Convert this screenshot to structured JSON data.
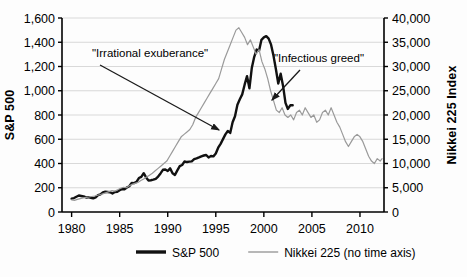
{
  "chart_data": {
    "type": "line",
    "title": "",
    "xlabel": "",
    "ylabel": "S&P 500",
    "y2label": "Nikkei 225 Index",
    "grid": true,
    "legend_position": "bottom",
    "xlim": [
      1979.0,
      2012.5
    ],
    "ylim": [
      0,
      1600
    ],
    "y2lim": [
      0,
      40000
    ],
    "x_ticks": [
      "1980",
      "1985",
      "1990",
      "1995",
      "2000",
      "2005",
      "2010"
    ],
    "x_tick_values": [
      1980,
      1985,
      1990,
      1995,
      2000,
      2005,
      2010
    ],
    "y_ticks": [
      "0",
      "200",
      "400",
      "600",
      "800",
      "1,000",
      "1,200",
      "1,400",
      "1,600"
    ],
    "y_tick_values": [
      0,
      200,
      400,
      600,
      800,
      1000,
      1200,
      1400,
      1600
    ],
    "y2_ticks": [
      "0",
      "5,000",
      "10,000",
      "15,000",
      "20,000",
      "25,000",
      "30,000",
      "35,000",
      "40,000"
    ],
    "y2_tick_values": [
      0,
      5000,
      10000,
      15000,
      20000,
      25000,
      30000,
      35000,
      40000
    ],
    "series": [
      {
        "name": "S&P 500",
        "axis": "left",
        "color": "#111111",
        "width": 2.4,
        "x": [
          1980.0,
          1980.25,
          1980.5,
          1980.75,
          1981.0,
          1981.25,
          1981.5,
          1981.75,
          1982.0,
          1982.25,
          1982.5,
          1982.75,
          1983.0,
          1983.25,
          1983.5,
          1983.75,
          1984.0,
          1984.25,
          1984.5,
          1984.75,
          1985.0,
          1985.25,
          1985.5,
          1985.75,
          1986.0,
          1986.25,
          1986.5,
          1986.75,
          1987.0,
          1987.25,
          1987.5,
          1987.75,
          1988.0,
          1988.25,
          1988.5,
          1988.75,
          1989.0,
          1989.25,
          1989.5,
          1989.75,
          1990.0,
          1990.25,
          1990.5,
          1990.75,
          1991.0,
          1991.25,
          1991.5,
          1991.75,
          1992.0,
          1992.25,
          1992.5,
          1992.75,
          1993.0,
          1993.25,
          1993.5,
          1993.75,
          1994.0,
          1994.25,
          1994.5,
          1994.75,
          1995.0,
          1995.25,
          1995.5,
          1995.75,
          1996.0,
          1996.25,
          1996.5,
          1996.75,
          1997.0,
          1997.25,
          1997.5,
          1997.75,
          1998.0,
          1998.25,
          1998.5,
          1998.75,
          1999.0,
          1999.25,
          1999.5,
          1999.75,
          2000.0,
          2000.25,
          2000.5,
          2000.75,
          2001.0,
          2001.25,
          2001.5,
          2001.75,
          2002.0,
          2002.25,
          2002.5,
          2002.75,
          2003.0
        ],
        "y": [
          110,
          115,
          126,
          136,
          132,
          128,
          120,
          122,
          117,
          112,
          120,
          139,
          145,
          162,
          167,
          165,
          163,
          153,
          165,
          167,
          180,
          188,
          188,
          202,
          212,
          240,
          238,
          248,
          280,
          290,
          320,
          285,
          260,
          262,
          267,
          274,
          292,
          318,
          348,
          350,
          338,
          360,
          320,
          306,
          343,
          378,
          388,
          417,
          412,
          415,
          418,
          436,
          442,
          450,
          459,
          466,
          470,
          450,
          462,
          459,
          482,
          530,
          562,
          601,
          640,
          668,
          652,
          740,
          790,
          885,
          930,
          970,
          1050,
          1120,
          1020,
          1190,
          1280,
          1340,
          1330,
          1420,
          1440,
          1450,
          1430,
          1380,
          1290,
          1180,
          1060,
          1140,
          1040,
          900,
          850,
          880,
          880
        ],
        "y_note": "Thick black line. Rises from ~110 in 1980 to peak ~1520 in early 2000, then falls to ~790 by 2003 where the plotted series ends."
      },
      {
        "name": "Nikkei 225 (no time axis)",
        "axis": "right",
        "color": "#9a9a9a",
        "width": 1.2,
        "x": [
          1980.0,
          1980.3,
          1980.6,
          1980.9,
          1981.2,
          1981.5,
          1981.8,
          1982.1,
          1982.4,
          1982.7,
          1983.0,
          1983.3,
          1983.6,
          1983.9,
          1984.2,
          1984.5,
          1984.8,
          1985.1,
          1985.4,
          1985.7,
          1986.0,
          1986.3,
          1986.6,
          1986.9,
          1987.2,
          1987.5,
          1987.8,
          1988.1,
          1988.4,
          1988.7,
          1989.0,
          1989.3,
          1989.6,
          1989.9,
          1990.2,
          1990.5,
          1990.8,
          1991.1,
          1991.4,
          1991.7,
          1992.0,
          1992.3,
          1992.6,
          1992.9,
          1993.2,
          1993.5,
          1993.8,
          1994.1,
          1994.4,
          1994.7,
          1995.0,
          1995.3,
          1995.6,
          1995.9,
          1996.2,
          1996.5,
          1996.8,
          1997.1,
          1997.4,
          1997.7,
          1998.0,
          1998.3,
          1998.6,
          1998.9,
          1999.2,
          1999.5,
          1999.8,
          2000.1,
          2000.4,
          2000.7,
          2001.0,
          2001.3,
          2001.6,
          2001.9,
          2002.2,
          2002.5,
          2002.8,
          2003.1,
          2003.4,
          2003.7,
          2004.0,
          2004.3,
          2004.6,
          2004.9,
          2005.2,
          2005.5,
          2005.8,
          2006.1,
          2006.4,
          2006.7,
          2007.0,
          2007.3,
          2007.6,
          2007.9,
          2008.2,
          2008.5,
          2008.8,
          2009.1,
          2009.4,
          2009.7,
          2010.0,
          2010.3,
          2010.6,
          2010.9,
          2011.2,
          2011.5,
          2011.8,
          2012.1,
          2012.3
        ],
        "y": [
          2500,
          2400,
          2600,
          2750,
          2900,
          3000,
          3100,
          3200,
          3300,
          3450,
          3600,
          3800,
          4000,
          4200,
          4400,
          4300,
          4600,
          4900,
          5100,
          5000,
          5400,
          5700,
          5900,
          6100,
          6500,
          6800,
          7200,
          7600,
          8000,
          8500,
          9000,
          9500,
          10000,
          10500,
          11500,
          12500,
          13500,
          14500,
          15500,
          16000,
          16500,
          17000,
          18000,
          19500,
          20500,
          21500,
          22500,
          23500,
          24500,
          25500,
          26500,
          27500,
          29500,
          31500,
          33000,
          34500,
          36000,
          37500,
          38000,
          37000,
          36000,
          34500,
          35500,
          34000,
          32500,
          33500,
          31000,
          29500,
          27500,
          25000,
          23000,
          21000,
          20500,
          21500,
          20000,
          19500,
          20000,
          19000,
          20500,
          21000,
          20000,
          21500,
          20500,
          19500,
          20000,
          18500,
          19000,
          20500,
          21000,
          20000,
          21500,
          20000,
          18500,
          17500,
          16000,
          14500,
          13500,
          14500,
          15500,
          16000,
          15500,
          14500,
          13000,
          11500,
          10500,
          10000,
          11000,
          10500,
          11000
        ],
        "y_note": "Thin grey line plotted on the right axis with no time axis (shifted/offset in time). Rises to a peak ~38,000 around 1999-2000 position, collapses to ~20,000 and drifts down to ~10,000-11,000 at the far right."
      }
    ],
    "annotations": [
      {
        "text": "\"Irrational  exuberance\"",
        "text_x": 92,
        "text_y": 57,
        "arrow_from": [
          100,
          65
        ],
        "arrow_to": [
          219,
          130
        ]
      },
      {
        "text": "\"Infectious greed\"",
        "text_x": 274,
        "text_y": 62,
        "arrow_from": [
          300,
          70
        ],
        "arrow_to": [
          272,
          100
        ]
      }
    ]
  },
  "legend": {
    "items": [
      {
        "label": "S&P 500",
        "color": "#111111",
        "width": 3.4
      },
      {
        "label": "Nikkei 225 (no time axis)",
        "color": "#a6a6a6",
        "width": 1.6
      }
    ]
  },
  "axes": {
    "left_title": "S&P 500",
    "right_title": "Nikkei 225 Index"
  }
}
